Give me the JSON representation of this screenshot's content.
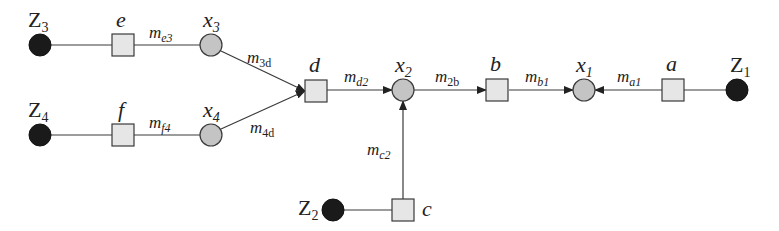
{
  "diagram": {
    "type": "factor-graph",
    "observed_nodes": [
      {
        "id": "Z1",
        "label": "Z",
        "sub": "1"
      },
      {
        "id": "Z2",
        "label": "Z",
        "sub": "2"
      },
      {
        "id": "Z3",
        "label": "Z",
        "sub": "3"
      },
      {
        "id": "Z4",
        "label": "Z",
        "sub": "4"
      }
    ],
    "variable_nodes": [
      {
        "id": "x1",
        "label": "x",
        "sub": "1"
      },
      {
        "id": "x2",
        "label": "x",
        "sub": "2"
      },
      {
        "id": "x3",
        "label": "x",
        "sub": "3"
      },
      {
        "id": "x4",
        "label": "x",
        "sub": "4"
      }
    ],
    "factor_nodes": [
      {
        "id": "a",
        "label": "a"
      },
      {
        "id": "b",
        "label": "b"
      },
      {
        "id": "c",
        "label": "c"
      },
      {
        "id": "d",
        "label": "d"
      },
      {
        "id": "e",
        "label": "e"
      },
      {
        "id": "f",
        "label": "f"
      }
    ],
    "messages": [
      {
        "id": "me3",
        "label": "m",
        "sub": "e3",
        "from": "e",
        "to": "x3"
      },
      {
        "id": "mf4",
        "label": "m",
        "sub": "f4",
        "from": "f",
        "to": "x4"
      },
      {
        "id": "m3d",
        "label": "m",
        "sub": "3d",
        "from": "x3",
        "to": "d"
      },
      {
        "id": "m4d",
        "label": "m",
        "sub": "4d",
        "from": "x4",
        "to": "d"
      },
      {
        "id": "md2",
        "label": "m",
        "sub": "d2",
        "from": "d",
        "to": "x2"
      },
      {
        "id": "mc2",
        "label": "m",
        "sub": "c2",
        "from": "c",
        "to": "x2"
      },
      {
        "id": "m2b",
        "label": "m",
        "sub": "2b",
        "from": "x2",
        "to": "b"
      },
      {
        "id": "mb1",
        "label": "m",
        "sub": "b1",
        "from": "b",
        "to": "x1"
      },
      {
        "id": "ma1",
        "label": "m",
        "sub": "a1",
        "from": "a",
        "to": "x1"
      }
    ],
    "colors": {
      "observed_fill": "#1a1a1a",
      "variable_fill": "#c4c4c4",
      "factor_fill": "#e6e6e6",
      "edge": "#3a3a3a"
    }
  }
}
